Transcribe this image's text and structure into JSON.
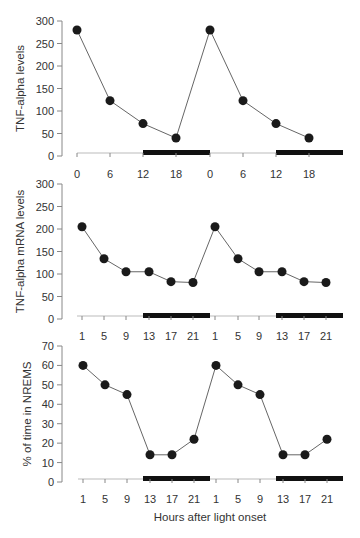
{
  "chart_data": [
    {
      "type": "line",
      "title": "",
      "ylabel": "TNF-alpha levels",
      "xlabel": "",
      "ylim": [
        0,
        300
      ],
      "yticks": [
        0,
        50,
        100,
        150,
        200,
        250,
        300
      ],
      "x": [
        "0",
        "6",
        "12",
        "18",
        "0",
        "6",
        "12",
        "18"
      ],
      "values": [
        280,
        123,
        72,
        40,
        280,
        123,
        72,
        40
      ],
      "dark_periods": [
        [
          12,
          24
        ],
        [
          36,
          48
        ]
      ],
      "grid": false,
      "legend": null
    },
    {
      "type": "line",
      "title": "",
      "ylabel": "TNF-alpha mRNA levels",
      "xlabel": "",
      "ylim": [
        0,
        300
      ],
      "yticks": [
        0,
        50,
        100,
        150,
        200,
        250,
        300
      ],
      "x": [
        "1",
        "5",
        "9",
        "13",
        "17",
        "21",
        "1",
        "5",
        "9",
        "13",
        "17",
        "21"
      ],
      "values": [
        205,
        134,
        105,
        105,
        83,
        81,
        205,
        134,
        105,
        105,
        83,
        81
      ],
      "dark_periods": [
        [
          12,
          24
        ],
        [
          36,
          48
        ]
      ],
      "grid": false,
      "legend": null
    },
    {
      "type": "line",
      "title": "",
      "ylabel": "% of time in NREMS",
      "xlabel": "Hours after light onset",
      "ylim": [
        0,
        70
      ],
      "yticks": [
        0,
        10,
        20,
        30,
        40,
        50,
        60,
        70
      ],
      "x": [
        "1",
        "5",
        "9",
        "13",
        "17",
        "21",
        "1",
        "5",
        "9",
        "13",
        "17",
        "21"
      ],
      "values": [
        60,
        50,
        45,
        14,
        14,
        22,
        60,
        50,
        45,
        14,
        14,
        22
      ],
      "dark_periods": [
        [
          12,
          24
        ],
        [
          36,
          48
        ]
      ],
      "grid": false,
      "legend": null
    }
  ],
  "labels": {
    "panel1_ylabel": "TNF-alpha levels",
    "panel2_ylabel": "TNF-alpha mRNA levels",
    "panel3_ylabel": "% of time in NREMS",
    "xlabel": "Hours after light onset"
  },
  "colors": {
    "marker": "#1a1a1a",
    "line": "#666666",
    "axis": "#888888",
    "bar": "#111111"
  }
}
